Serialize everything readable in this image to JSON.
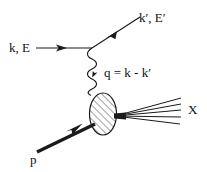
{
  "figure": {
    "background_color": "#ffffff",
    "line_color": "#1a1a1a",
    "width": 207,
    "height": 172
  },
  "labels": {
    "incoming_lepton": "k, E",
    "outgoing_lepton": "k′, E′",
    "exchanged_boson": "q = k - k′",
    "incoming_hadron": "p",
    "final_state": "X"
  },
  "elements": {
    "incoming_lepton_line": {
      "name": "incoming lepton line",
      "arrow": "right"
    },
    "outgoing_lepton_line": {
      "name": "outgoing lepton line",
      "arrow": "up-right"
    },
    "photon_propagator": {
      "name": "virtual photon wavy propagator",
      "style": "wavy"
    },
    "hadron_blob": {
      "name": "hatched ellipse blob",
      "hatch": "diagonal"
    },
    "proton_line": {
      "name": "incoming proton thick arrow",
      "arrow": "up-right"
    },
    "final_state_fan": {
      "name": "final state hadron fan",
      "line_count": 5
    }
  }
}
